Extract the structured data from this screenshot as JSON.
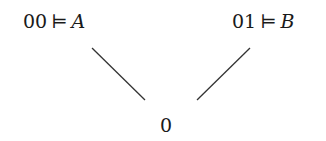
{
  "diagram": {
    "type": "tree",
    "nodes": {
      "left": {
        "label": "00",
        "relation": "⊨",
        "formula": "A"
      },
      "right": {
        "label": "01",
        "relation": "⊨",
        "formula": "B"
      },
      "root": {
        "label": "0"
      }
    },
    "edges": [
      {
        "from": "root",
        "to": "left"
      },
      {
        "from": "root",
        "to": "right"
      }
    ],
    "line_color": "#333333"
  }
}
